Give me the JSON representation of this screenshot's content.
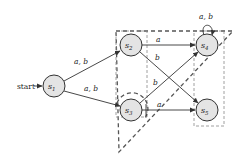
{
  "diagram": {
    "type": "finite-automaton",
    "start_label": "start",
    "states": [
      {
        "id": "s1",
        "label": "s",
        "sub": "1",
        "x": 54,
        "y": 86
      },
      {
        "id": "s2",
        "label": "s",
        "sub": "2",
        "x": 131,
        "y": 45
      },
      {
        "id": "s3",
        "label": "s",
        "sub": "3",
        "x": 131,
        "y": 110
      },
      {
        "id": "s4",
        "label": "s",
        "sub": "4",
        "x": 207,
        "y": 45
      },
      {
        "id": "s5",
        "label": "s",
        "sub": "5",
        "x": 207,
        "y": 110
      }
    ],
    "edges": [
      {
        "from": "s1",
        "to": "s2",
        "label": "a, b"
      },
      {
        "from": "s1",
        "to": "s3",
        "label": "a, b"
      },
      {
        "from": "s2",
        "to": "s4",
        "label": "a"
      },
      {
        "from": "s2",
        "to": "s5",
        "label": "b"
      },
      {
        "from": "s3",
        "to": "s4",
        "label": "b"
      },
      {
        "from": "s3",
        "to": "s5",
        "label": "a"
      },
      {
        "from": "s4",
        "to": "s4",
        "label": "a, b"
      }
    ],
    "colors": {
      "node_fill": "#e4e4e4",
      "stroke": "#333333",
      "dashed_region": "#555555",
      "dashed_box": "#888888"
    }
  }
}
